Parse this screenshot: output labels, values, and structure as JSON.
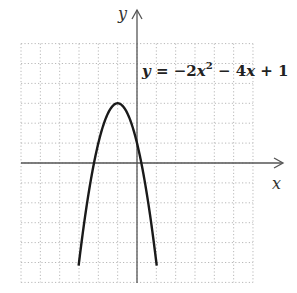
{
  "chart_data": {
    "type": "line",
    "title": "",
    "equation": "y = −2x² − 4x + 1",
    "equation_parts": {
      "lhs": "y",
      "eq": " = −2",
      "x1": "x",
      "exp": "2",
      "mid": " − 4",
      "x2": "x",
      "tail": " + 1"
    },
    "xlabel": "x",
    "ylabel": "y",
    "xlim": [
      -6,
      6
    ],
    "ylim": [
      -6,
      6
    ],
    "grid": true,
    "grid_style": "dotted",
    "tick_labels_shown": false,
    "series": [
      {
        "name": "y = −2x² − 4x + 1",
        "function": "-2*x^2 - 4*x + 1",
        "vertex": [
          -1,
          3
        ],
        "x": [
          -3.02,
          -2.5,
          -2,
          -1.5,
          -1,
          -0.5,
          0,
          0.5,
          1.02
        ],
        "y": [
          -5.2,
          -1.5,
          1,
          2.5,
          3,
          2.5,
          1,
          -1.5,
          -5.2
        ],
        "color": "#1a1a1a"
      }
    ]
  },
  "colors": {
    "axis": "#555555",
    "grid": "#bbbbbb",
    "curve": "#1a1a1a"
  }
}
